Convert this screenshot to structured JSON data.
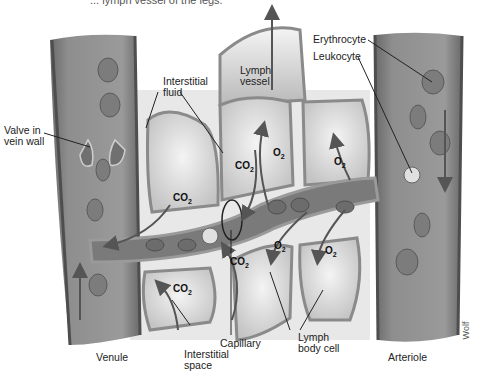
{
  "caption": "... lymph vessel of the legs.",
  "labels": {
    "valve": "Valve in\nvein wall",
    "interstitial_fluid": "Interstitial\nfluid",
    "lymph_vessel": "Lymph\nvessel",
    "erythrocyte": "Erythrocyte",
    "leukocyte": "Leukocyte",
    "venule": "Venule",
    "interstitial_space": "Interstitial\nspace",
    "capillary": "Capillary",
    "lymph_body_cell": "Lymph\nbody cell",
    "arteriole": "Arteriole",
    "signature": "Wolf"
  },
  "gases": {
    "co2": "CO",
    "o2": "O",
    "sub": "2"
  },
  "colors": {
    "vessel_wall": "#6e6e6e",
    "vessel_lumen": "#9a9a9a",
    "cell_fill": "#d8d8d8",
    "cell_border": "#8a8a8a",
    "arrow": "#555555",
    "background": "#ffffff"
  }
}
